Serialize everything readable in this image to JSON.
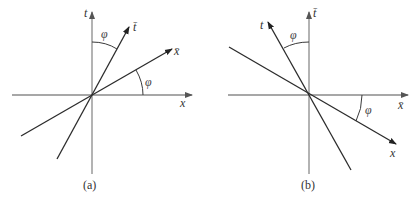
{
  "panels": [
    {
      "caption": "(a)",
      "vertical_axis_label": "t",
      "horizontal_axis_label": "x",
      "rotated_time_label": "t̄",
      "rotated_space_label": "x̄",
      "angle_label_top": "φ",
      "angle_label_right": "φ"
    },
    {
      "caption": "(b)",
      "vertical_axis_label": "t̄",
      "horizontal_axis_label": "x̄",
      "rotated_time_label": "t",
      "rotated_space_label": "x",
      "angle_label_top": "φ",
      "angle_label_right": "φ"
    }
  ]
}
